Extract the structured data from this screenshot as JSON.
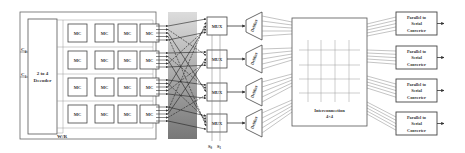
{
  "memory": {
    "decoder_label_1": "2 to 4",
    "decoder_label_2": "Decoder",
    "input_c0": "C",
    "input_c0_sub": "0",
    "input_c1": "C",
    "input_c1_sub": "1",
    "wr_label": "W/R",
    "cell_label": "MC",
    "rows": 4,
    "cols": 4
  },
  "mux": {
    "label": "MUX",
    "count": 4,
    "select_s0": "S",
    "select_s0_sub": "0",
    "select_s1": "S",
    "select_s1_sub": "1"
  },
  "demux": {
    "label": "DeMux",
    "count": 4
  },
  "interconnection": {
    "label_1": "Interconnection",
    "label_2": "4×4"
  },
  "converters": [
    {
      "line1": "Parallel to",
      "line2": "Serial",
      "line3": "Converter"
    },
    {
      "line1": "Parallel to",
      "line2": "Serial",
      "line3": "Converter"
    },
    {
      "line1": "Parallel to",
      "line2": "Serial",
      "line3": "Converter"
    },
    {
      "line1": "Parallel to",
      "line2": "Serial",
      "line3": "Converter"
    }
  ],
  "colors": {
    "line": "#444444",
    "box_border": "#555555",
    "gradient_top": "#d9d9d9",
    "gradient_bottom": "#7a7a7a"
  }
}
